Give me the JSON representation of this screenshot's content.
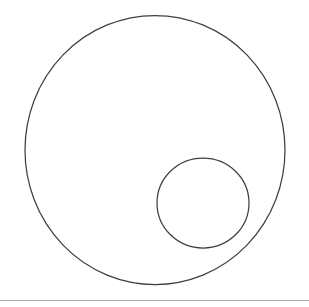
{
  "document": {
    "title": "Two Circles Diagram",
    "background_color": "#ffffff",
    "width": 309,
    "height": 307
  },
  "figure": {
    "type": "geometric-line-drawing",
    "stroke_color": "#3f3f3f",
    "fill_color": "none",
    "shapes": [
      {
        "name": "large-circle",
        "kind": "ellipse",
        "cx": 155,
        "cy": 150,
        "rx": 130,
        "ry": 134.5,
        "stroke": "#3f3f3f",
        "stroke_width": 1.25,
        "fill": "none",
        "bounds": {
          "left": 25,
          "top": 15.5,
          "right": 285,
          "bottom": 284.5
        }
      },
      {
        "name": "small-circle",
        "kind": "ellipse",
        "cx": 203,
        "cy": 203,
        "rx": 46,
        "ry": 45,
        "stroke": "#3f3f3f",
        "stroke_width": 1.25,
        "fill": "none",
        "bounds": {
          "left": 157,
          "top": 158,
          "right": 249,
          "bottom": 248
        }
      },
      {
        "name": "bottom-rule",
        "kind": "line",
        "x1": 0,
        "y1": 300.5,
        "x2": 309,
        "y2": 300.5,
        "stroke": "#8c8c8c",
        "stroke_width": 1,
        "opacity": 0.75
      }
    ]
  },
  "chart_data": {
    "type": "scatter",
    "title": "",
    "xlabel": "",
    "ylabel": "",
    "grid": false,
    "legend": "none",
    "xlim": [
      0,
      309
    ],
    "ylim": [
      0,
      307
    ],
    "annotations": [],
    "series": [
      {
        "name": "large-circle",
        "shape": "circle",
        "center": [
          155,
          150
        ],
        "radius_x": 130,
        "radius_y": 134.5,
        "filled": false
      },
      {
        "name": "small-circle",
        "shape": "circle",
        "center": [
          203,
          203
        ],
        "radius_x": 46,
        "radius_y": 45,
        "filled": false
      }
    ]
  }
}
